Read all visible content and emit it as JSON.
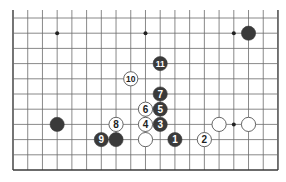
{
  "diagram": {
    "type": "go-board-fragment",
    "columns": 19,
    "rows": 11,
    "grid": {
      "origin_x": 13,
      "origin_y": 18,
      "step_x": 14.72,
      "step_y": 15.2,
      "line_extension_top": 8,
      "edges": [
        "left",
        "right",
        "bottom"
      ]
    },
    "colors": {
      "background": "#ffffff",
      "line": "#6b6b6b",
      "edge": "#3a3a3a",
      "black_stone": "#3a3a3a",
      "white_stone": "#ffffff",
      "white_stone_border": "#555555",
      "hoshi": "#222222"
    },
    "hoshi": [
      {
        "col": 3,
        "row": 1
      },
      {
        "col": 9,
        "row": 1
      },
      {
        "col": 15,
        "row": 1
      },
      {
        "col": 15,
        "row": 7
      }
    ],
    "stones": [
      {
        "color": "black",
        "col": 16,
        "row": 1,
        "label": ""
      },
      {
        "color": "black",
        "col": 11,
        "row": 8,
        "label": "1"
      },
      {
        "color": "white",
        "col": 13,
        "row": 8,
        "label": "2"
      },
      {
        "color": "black",
        "col": 10,
        "row": 7,
        "label": "3"
      },
      {
        "color": "white",
        "col": 9,
        "row": 7,
        "label": "4"
      },
      {
        "color": "black",
        "col": 10,
        "row": 6,
        "label": "5"
      },
      {
        "color": "white",
        "col": 9,
        "row": 6,
        "label": "6"
      },
      {
        "color": "black",
        "col": 10,
        "row": 5,
        "label": "7"
      },
      {
        "color": "white",
        "col": 7,
        "row": 7,
        "label": "8"
      },
      {
        "color": "black",
        "col": 6,
        "row": 8,
        "label": "9"
      },
      {
        "color": "white",
        "col": 8,
        "row": 4,
        "label": "10"
      },
      {
        "color": "black",
        "col": 10,
        "row": 3,
        "label": "11"
      },
      {
        "color": "black",
        "col": 3,
        "row": 7,
        "label": ""
      },
      {
        "color": "black",
        "col": 7,
        "row": 8,
        "label": ""
      },
      {
        "color": "white",
        "col": 9,
        "row": 8,
        "label": ""
      },
      {
        "color": "white",
        "col": 14,
        "row": 7,
        "label": ""
      },
      {
        "color": "white",
        "col": 16,
        "row": 7,
        "label": ""
      }
    ]
  }
}
